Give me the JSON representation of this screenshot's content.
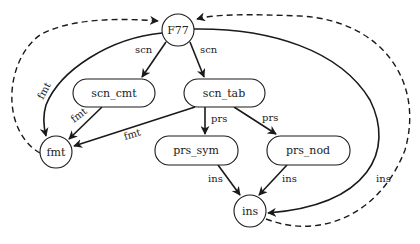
{
  "diagram": {
    "type": "dependency-graph",
    "colors": {
      "stroke": "#1a1a1a",
      "background": "#ffffff",
      "text": "#222222"
    },
    "nodes": {
      "f77": {
        "label": "F77",
        "shape": "circle"
      },
      "scn_cmt": {
        "label": "scn_cmt",
        "shape": "rounded-rect"
      },
      "scn_tab": {
        "label": "scn_tab",
        "shape": "rounded-rect"
      },
      "fmt": {
        "label": "fmt",
        "shape": "circle"
      },
      "prs_sym": {
        "label": "prs_sym",
        "shape": "rounded-rect"
      },
      "prs_nod": {
        "label": "prs_nod",
        "shape": "rounded-rect"
      },
      "ins": {
        "label": "ins",
        "shape": "circle"
      }
    },
    "edges": {
      "f77_scn_cmt": {
        "from": "F77",
        "to": "scn_cmt",
        "label": "scn",
        "style": "solid"
      },
      "f77_scn_tab": {
        "from": "F77",
        "to": "scn_tab",
        "label": "scn",
        "style": "solid"
      },
      "f77_fmt": {
        "from": "F77",
        "to": "fmt",
        "label": "fmt",
        "style": "solid"
      },
      "scn_cmt_fmt": {
        "from": "scn_cmt",
        "to": "fmt",
        "label": "fmt",
        "style": "solid"
      },
      "scn_tab_fmt": {
        "from": "scn_tab",
        "to": "fmt",
        "label": "fmt",
        "style": "solid"
      },
      "scn_tab_prs_sym": {
        "from": "scn_tab",
        "to": "prs_sym",
        "label": "prs",
        "style": "solid"
      },
      "scn_tab_prs_nod": {
        "from": "scn_tab",
        "to": "prs_nod",
        "label": "prs",
        "style": "solid"
      },
      "prs_sym_ins": {
        "from": "prs_sym",
        "to": "ins",
        "label": "ins",
        "style": "solid"
      },
      "prs_nod_ins": {
        "from": "prs_nod",
        "to": "ins",
        "label": "ins",
        "style": "solid"
      },
      "f77_ins": {
        "from": "F77",
        "to": "ins",
        "label": "ins",
        "style": "solid"
      },
      "fmt_f77_return": {
        "from": "fmt",
        "to": "F77",
        "label": "",
        "style": "dashed"
      },
      "ins_f77_return": {
        "from": "ins",
        "to": "F77",
        "label": "",
        "style": "dashed"
      }
    }
  }
}
